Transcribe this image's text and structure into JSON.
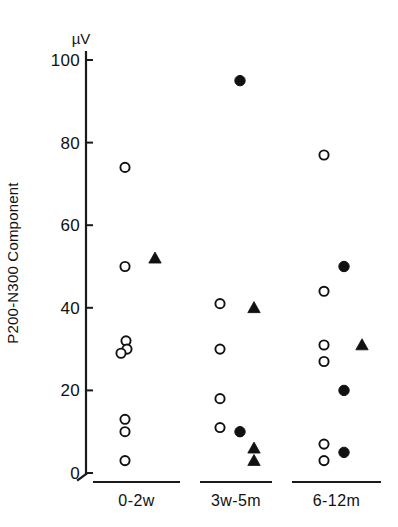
{
  "chart_data": {
    "type": "scatter",
    "title": "",
    "subtitle": "",
    "xlabel": "",
    "ylabel": "P200-N300 Component",
    "yunit": "µV",
    "ylim": [
      0,
      100
    ],
    "yticks": [
      0,
      20,
      40,
      60,
      80,
      100
    ],
    "ytick_labels": [
      "0",
      "20",
      "40",
      "60",
      "80",
      "100"
    ],
    "grid": false,
    "legend_position": "none",
    "categories": [
      "0-2w",
      "3w-5m",
      "6-12m"
    ],
    "marker_styles": {
      "open_circle": "open-circle-marker",
      "filled_circle": "filled-circle-marker",
      "filled_triangle": "filled-triangle-marker"
    },
    "groups": [
      {
        "label": "0-2w",
        "points": [
          {
            "marker": "open_circle",
            "value": 74,
            "jitter": 0
          },
          {
            "marker": "open_circle",
            "value": 50,
            "jitter": 0
          },
          {
            "marker": "filled_triangle",
            "value": 52,
            "jitter": 30
          },
          {
            "marker": "open_circle",
            "value": 32,
            "jitter": 1
          },
          {
            "marker": "open_circle",
            "value": 30,
            "jitter": 2
          },
          {
            "marker": "open_circle",
            "value": 29,
            "jitter": -4
          },
          {
            "marker": "open_circle",
            "value": 13,
            "jitter": 0
          },
          {
            "marker": "open_circle",
            "value": 10,
            "jitter": 0
          },
          {
            "marker": "open_circle",
            "value": 3,
            "jitter": 0
          }
        ]
      },
      {
        "label": "3w-5m",
        "points": [
          {
            "marker": "filled_circle",
            "value": 95,
            "jitter": 10
          },
          {
            "marker": "open_circle",
            "value": 41,
            "jitter": -10
          },
          {
            "marker": "filled_triangle",
            "value": 40,
            "jitter": 24
          },
          {
            "marker": "open_circle",
            "value": 30,
            "jitter": -10
          },
          {
            "marker": "open_circle",
            "value": 18,
            "jitter": -10
          },
          {
            "marker": "open_circle",
            "value": 11,
            "jitter": -10
          },
          {
            "marker": "filled_circle",
            "value": 10,
            "jitter": 10
          },
          {
            "marker": "filled_triangle",
            "value": 6,
            "jitter": 24
          },
          {
            "marker": "filled_triangle",
            "value": 3,
            "jitter": 24
          }
        ]
      },
      {
        "label": "6-12m",
        "points": [
          {
            "marker": "open_circle",
            "value": 77,
            "jitter": -8
          },
          {
            "marker": "filled_circle",
            "value": 50,
            "jitter": 12
          },
          {
            "marker": "open_circle",
            "value": 44,
            "jitter": -8
          },
          {
            "marker": "open_circle",
            "value": 31,
            "jitter": -8
          },
          {
            "marker": "filled_triangle",
            "value": 31,
            "jitter": 30
          },
          {
            "marker": "open_circle",
            "value": 27,
            "jitter": -8
          },
          {
            "marker": "filled_circle",
            "value": 20,
            "jitter": 12
          },
          {
            "marker": "filled_circle",
            "value": 5,
            "jitter": 12
          },
          {
            "marker": "open_circle",
            "value": 7,
            "jitter": -8
          },
          {
            "marker": "open_circle",
            "value": 3,
            "jitter": -8
          }
        ]
      }
    ]
  }
}
